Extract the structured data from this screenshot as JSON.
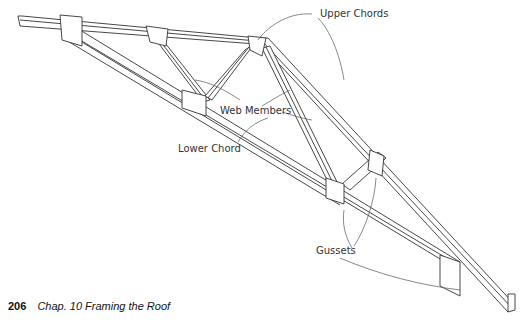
{
  "figure": {
    "labels": {
      "upper_chords": "Upper Chords",
      "web_members": "Web Members",
      "lower_chord": "Lower Chord",
      "gussets": "Gussets"
    }
  },
  "footer": {
    "page_number": "206",
    "caption": "Chap. 10  Framing the Roof"
  }
}
